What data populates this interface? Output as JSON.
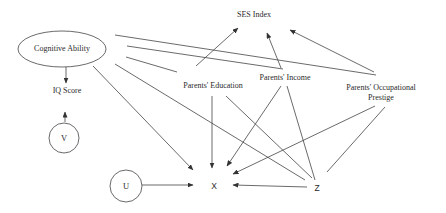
{
  "diagram": {
    "type": "causal-graph",
    "nodes": {
      "cognitive_ability": {
        "label": "Cognitive Ability",
        "shape": "ellipse"
      },
      "ses_index": {
        "label": "SES Index",
        "shape": "text"
      },
      "iq_score": {
        "label": "IQ Score",
        "shape": "text"
      },
      "v": {
        "label": "V",
        "shape": "circle"
      },
      "u": {
        "label": "U",
        "shape": "circle"
      },
      "x": {
        "label": "X",
        "shape": "text"
      },
      "z": {
        "label": "Z",
        "shape": "text"
      },
      "parents_education": {
        "label": "Parents' Education",
        "shape": "text"
      },
      "parents_income": {
        "label": "Parents' Income",
        "shape": "text"
      },
      "parents_occupational_prestige": {
        "label_line1": "Parents' Occupational",
        "label_line2": "Prestige",
        "shape": "text"
      }
    },
    "edges": [
      {
        "from": "Cognitive Ability",
        "to": "IQ Score",
        "directed": true
      },
      {
        "from": "V",
        "to": "IQ Score",
        "directed": true
      },
      {
        "from": "Cognitive Ability",
        "to": "X",
        "directed": true
      },
      {
        "from": "Cognitive Ability",
        "to": "Z",
        "directed": false
      },
      {
        "from": "Cognitive Ability",
        "to": "Parents' Education",
        "directed": false
      },
      {
        "from": "Cognitive Ability",
        "to": "Parents' Income",
        "directed": false
      },
      {
        "from": "Cognitive Ability",
        "to": "Parents' Occupational Prestige",
        "directed": false
      },
      {
        "from": "Parents' Education",
        "to": "SES Index",
        "directed": true
      },
      {
        "from": "Parents' Income",
        "to": "SES Index",
        "directed": true
      },
      {
        "from": "Parents' Occupational Prestige",
        "to": "SES Index",
        "directed": true
      },
      {
        "from": "Parents' Education",
        "to": "X",
        "directed": true
      },
      {
        "from": "Parents' Income",
        "to": "X",
        "directed": true
      },
      {
        "from": "Parents' Occupational Prestige",
        "to": "X",
        "directed": true
      },
      {
        "from": "Parents' Education",
        "to": "Z",
        "directed": false
      },
      {
        "from": "Parents' Income",
        "to": "Z",
        "directed": false
      },
      {
        "from": "Parents' Occupational Prestige",
        "to": "Z",
        "directed": false
      },
      {
        "from": "Z",
        "to": "X",
        "directed": true
      },
      {
        "from": "U",
        "to": "X",
        "directed": true
      }
    ]
  }
}
